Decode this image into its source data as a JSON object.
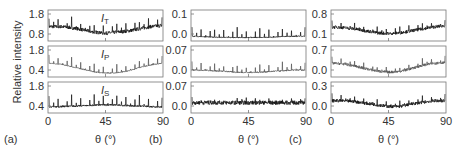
{
  "figure": {
    "ylabel": "Relative intensity",
    "xlabel": "θ (°)",
    "x_ticks": [
      "0",
      "45",
      "90"
    ]
  },
  "chart_data": [
    {
      "type": "line",
      "panel": "(a)",
      "xlabel": "θ (°)",
      "ylabel": "Relative intensity",
      "xlim": [
        0,
        90
      ],
      "x_ticks": [
        0,
        45,
        90
      ],
      "subplots": [
        {
          "series": "I_T",
          "label_main": "I",
          "label_sub": "T",
          "yticks": [
            "1.8",
            "0.8"
          ],
          "ylim": [
            0.6,
            2.0
          ],
          "baseline": [
            1.25,
            1.25,
            1.2,
            1.1,
            1.0,
            0.95,
            1.0,
            1.05,
            1.15,
            1.25,
            1.3
          ],
          "peak_height": 0.45,
          "color": "#111111",
          "noise": 0.08
        },
        {
          "series": "I_P",
          "label_main": "I",
          "label_sub": "P",
          "yticks": [
            "1.8",
            "0.4"
          ],
          "ylim": [
            0.2,
            2.0
          ],
          "baseline": [
            1.0,
            0.95,
            0.8,
            0.65,
            0.5,
            0.42,
            0.45,
            0.55,
            0.75,
            0.9,
            1.0
          ],
          "peak_height": 0.55,
          "color": "#555555",
          "noise": 0.03
        },
        {
          "series": "I_S",
          "label_main": "I",
          "label_sub": "S",
          "yticks": [
            "1.8",
            "0.4"
          ],
          "ylim": [
            0.2,
            2.0
          ],
          "baseline": [
            0.55,
            0.57,
            0.6,
            0.62,
            0.65,
            0.68,
            0.66,
            0.63,
            0.6,
            0.57,
            0.55
          ],
          "peak_height": 0.7,
          "color": "#111111",
          "noise": 0.05
        }
      ]
    },
    {
      "type": "line",
      "panel": "(b)",
      "xlabel": "θ (°)",
      "xlim": [
        0,
        90
      ],
      "x_ticks": [
        0,
        45,
        90
      ],
      "subplots": [
        {
          "series": "I_T",
          "yticks": [
            "0.1",
            "0.0"
          ],
          "ylim": [
            -0.01,
            0.12
          ],
          "baseline": [
            0.01,
            0.008,
            0.006,
            0.005,
            0.004,
            0.004,
            0.005,
            0.006,
            0.008,
            0.01,
            0.01
          ],
          "peak_height": 0.045,
          "color": "#111111",
          "noise": 0.002
        },
        {
          "series": "I_P",
          "yticks": [
            "0.07",
            "0.0"
          ],
          "ylim": [
            -0.01,
            0.08
          ],
          "baseline": [
            0.01,
            0.01,
            0.008,
            0.006,
            0.004,
            0.003,
            0.004,
            0.006,
            0.008,
            0.01,
            0.01
          ],
          "peak_height": 0.025,
          "color": "#555555",
          "noise": 0.002
        },
        {
          "series": "I_S",
          "yticks": [
            "0.07",
            "0.0"
          ],
          "ylim": [
            -0.01,
            0.08
          ],
          "baseline": [
            0.02,
            0.02,
            0.02,
            0.02,
            0.02,
            0.02,
            0.02,
            0.02,
            0.02,
            0.02,
            0.02
          ],
          "peak_height": 0.015,
          "color": "#111111",
          "noise": 0.006
        }
      ]
    },
    {
      "type": "line",
      "panel": "(c)",
      "xlabel": "θ (°)",
      "xlim": [
        0,
        90
      ],
      "x_ticks": [
        0,
        45,
        90
      ],
      "subplots": [
        {
          "series": "I_T",
          "yticks": [
            "0.8",
            "0.1"
          ],
          "ylim": [
            -0.05,
            0.9
          ],
          "baseline": [
            0.38,
            0.36,
            0.32,
            0.26,
            0.2,
            0.18,
            0.2,
            0.26,
            0.32,
            0.38,
            0.42
          ],
          "peak_height": 0.2,
          "color": "#111111",
          "noise": 0.05
        },
        {
          "series": "I_P",
          "yticks": [
            "0.7",
            "0.0"
          ],
          "ylim": [
            -0.1,
            0.8
          ],
          "baseline": [
            0.3,
            0.28,
            0.22,
            0.14,
            0.07,
            0.04,
            0.06,
            0.14,
            0.24,
            0.3,
            0.32
          ],
          "peak_height": 0.18,
          "color": "#555555",
          "noise": 0.04
        },
        {
          "series": "I_S",
          "yticks": [
            "0.3",
            "0.0"
          ],
          "ylim": [
            -0.05,
            0.33
          ],
          "baseline": [
            0.1,
            0.1,
            0.09,
            0.07,
            0.05,
            0.03,
            0.03,
            0.06,
            0.08,
            0.1,
            0.1
          ],
          "peak_height": 0.08,
          "color": "#111111",
          "noise": 0.02
        }
      ]
    }
  ],
  "panels": [
    {
      "label": "(a)"
    },
    {
      "label": "(b)"
    },
    {
      "label": "(c)"
    }
  ]
}
